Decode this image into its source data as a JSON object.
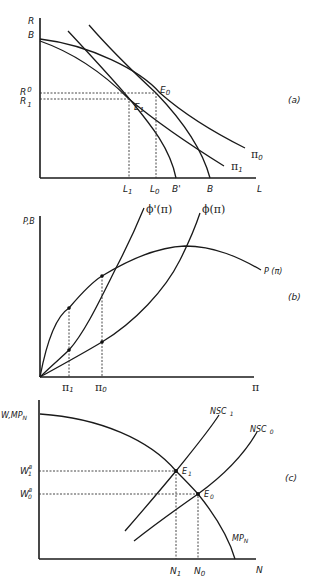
{
  "figure": {
    "panels": [
      {
        "id": "a",
        "panel_label": "(a)",
        "y_axis_label": "R",
        "x_axis_label": "L",
        "y_ticks": {
          "B": "B",
          "R0": "R",
          "R0_sub": "0",
          "R1": "R",
          "R1_sub": "1"
        },
        "x_ticks": {
          "L1": "L",
          "L1_sub": "1",
          "L0": "L",
          "L0_sub": "0",
          "Bprime": "B'",
          "B": "B"
        },
        "curves": {
          "pi0": "π",
          "pi0_sub": "0",
          "pi1": "π",
          "pi1_sub": "1"
        },
        "points": {
          "E0": "E",
          "E0_sub": "0",
          "E1": "E",
          "E1_sub": "1"
        }
      },
      {
        "id": "b",
        "panel_label": "(b)",
        "y_axis_label": "P,B",
        "x_axis_label": "π",
        "x_ticks": {
          "pi1": "π",
          "pi1_sub": "1",
          "pi0": "π",
          "pi0_sub": "0"
        },
        "curves": {
          "phi_prime": "ϕ'(π)",
          "phi": "ϕ(π)",
          "P": "P (π)"
        }
      },
      {
        "id": "c",
        "panel_label": "(c)",
        "y_axis_label": "W,MP",
        "y_axis_label_sub": "N",
        "x_axis_label": "N",
        "y_ticks": {
          "W1B": "W",
          "W1B_sub": "1",
          "W1B_sup": "B",
          "W0B": "W",
          "W0B_sub": "0",
          "W0B_sup": "B"
        },
        "x_ticks": {
          "N1": "N",
          "N1_sub": "1",
          "N0": "N",
          "N0_sub": "0"
        },
        "curves": {
          "NSC1": "NSC",
          "NSC1_sub": "1",
          "NSC0": "NSC",
          "NSC0_sub": "0",
          "MPN": "MP",
          "MPN_sub": "N"
        },
        "points": {
          "E1": "E",
          "E1_sub": "1",
          "E0": "E",
          "E0_sub": "0"
        }
      }
    ]
  }
}
